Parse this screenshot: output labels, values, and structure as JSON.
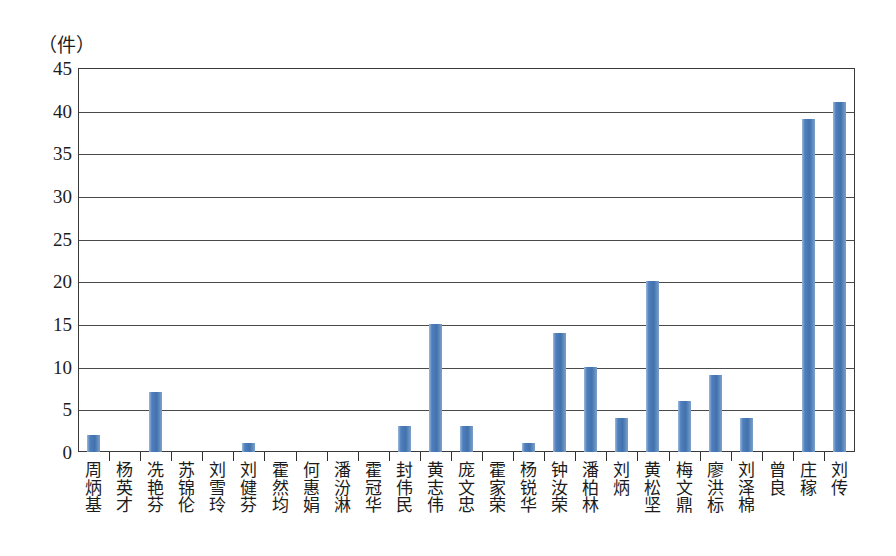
{
  "chart_data": {
    "type": "bar",
    "title": "",
    "subtitle": "",
    "xlabel": "",
    "ylabel": "（件）",
    "unit_label": "（件）",
    "ylim": [
      0,
      45
    ],
    "ytick_step": 5,
    "yticks": [
      45,
      40,
      35,
      30,
      25,
      20,
      15,
      10,
      5,
      0
    ],
    "grid": true,
    "grid_axis": "y",
    "legend": false,
    "legend_position": "none",
    "bar_color": "#4F81BD",
    "axis_color": "#3A3A3A",
    "categories": [
      "周炳基",
      "杨英才",
      "冼艳芬",
      "苏锦伦",
      "刘雪玲",
      "刘健芬",
      "霍然均",
      "何惠娟",
      "潘汾淋",
      "霍冠华",
      "封伟民",
      "黄志伟",
      "庞文忠",
      "霍家荣",
      "杨锐华",
      "钟汝荣",
      "潘柏林",
      "刘炳",
      "黄松坚",
      "梅文鼎",
      "廖洪标",
      "刘泽棉",
      "曾良",
      "庄稼",
      "刘传"
    ],
    "values": [
      2,
      0,
      7,
      0,
      0,
      1,
      0,
      0,
      0,
      0,
      3,
      15,
      3,
      0,
      1,
      14,
      10,
      4,
      20,
      6,
      9,
      4,
      0,
      39,
      41
    ]
  }
}
